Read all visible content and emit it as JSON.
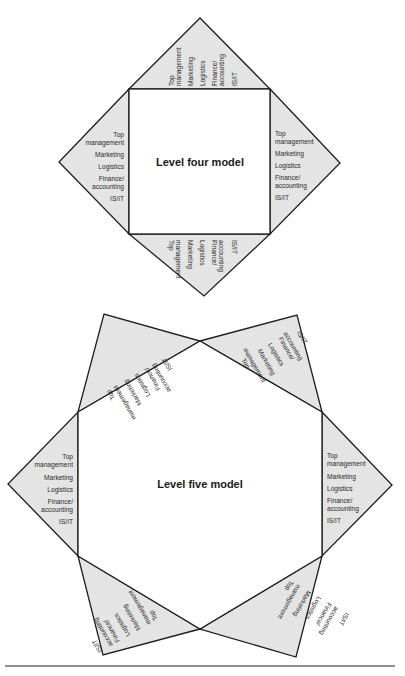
{
  "level_four": {
    "title": "Level four model",
    "functions": [
      "Top",
      "management",
      "Marketing",
      "Logistics",
      "Finance/",
      "accounting",
      "IS/IT"
    ]
  },
  "level_five": {
    "title": "Level five model",
    "functions": [
      "Top",
      "management",
      "Marketing",
      "Logistics",
      "Finance/",
      "accounting",
      "IS/IT"
    ]
  },
  "colors": {
    "triangle_fill": "#e4e4e4",
    "stroke": "#1e1e1e",
    "core_fill": "#ffffff"
  }
}
